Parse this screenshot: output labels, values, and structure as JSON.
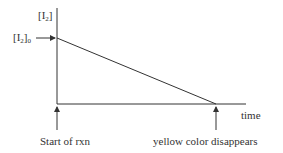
{
  "diagram": {
    "title": "",
    "y_axis_label": "[I2]",
    "y_axis_label_main": "[I",
    "y_axis_label_sub": "2",
    "y_axis_label_close": "]",
    "y0_label_main": "[I",
    "y0_label_sub1": "2",
    "y0_label_close": "]",
    "y0_label_sub2": "0",
    "x_axis_label": "time",
    "start_annotation": "Start of rxn",
    "end_annotation": "yellow color disappears",
    "line_description": "linear decrease of [I2] from [I2]0 at start to zero when yellow color disappears",
    "colors": {
      "axis": "#333333",
      "line": "#333333",
      "text": "#333333",
      "background": "#ffffff"
    }
  }
}
